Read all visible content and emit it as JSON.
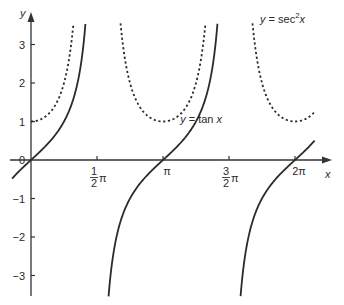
{
  "chart_data": {
    "type": "line",
    "title": "",
    "xlabel": "x",
    "ylabel": "y",
    "xlim": [
      -0.45,
      6.75
    ],
    "ylim": [
      -3.55,
      3.55
    ],
    "grid": false,
    "legend": "inline annotations",
    "x_ticks": [
      {
        "value": 1.5708,
        "label_num": "1",
        "label_den": "2",
        "label_suffix": "π"
      },
      {
        "value": 3.1416,
        "label": "π"
      },
      {
        "value": 4.7124,
        "label_num": "3",
        "label_den": "2",
        "label_suffix": "π"
      },
      {
        "value": 6.2832,
        "label": "2π"
      }
    ],
    "y_ticks": [
      {
        "value": 3,
        "label": "3"
      },
      {
        "value": 2,
        "label": "2"
      },
      {
        "value": 1,
        "label": "1"
      },
      {
        "value": 0,
        "label": "0"
      },
      {
        "value": -1,
        "label": "−1"
      },
      {
        "value": -2,
        "label": "−2"
      },
      {
        "value": -3,
        "label": "−3"
      }
    ],
    "series": [
      {
        "name": "y = tan x",
        "style": "solid",
        "function": "tan",
        "branches": [
          [
            -0.45,
            1.295
          ],
          [
            1.846,
            4.437
          ],
          [
            4.988,
            6.75
          ]
        ]
      },
      {
        "name": "y = sec²x",
        "style": "dotted",
        "function": "sec2",
        "branches": [
          [
            0,
            1.01
          ],
          [
            2.13,
            4.15
          ],
          [
            5.27,
            6.75
          ]
        ]
      }
    ],
    "annotations": [
      {
        "text_prefix": "y = tan ",
        "text_var": "x",
        "x": 3.55,
        "y": 0.95
      },
      {
        "text_prefix": "y = sec",
        "text_sup": "2",
        "text_var": "x",
        "x": 5.45,
        "y": 3.55
      }
    ]
  }
}
